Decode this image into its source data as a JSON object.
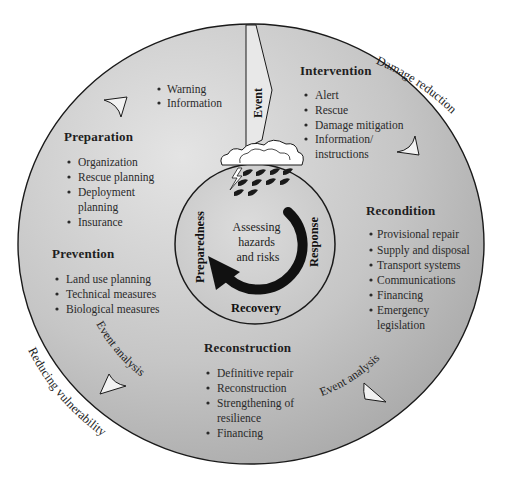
{
  "diagram": {
    "center": {
      "lines": [
        "Assessing",
        "hazards",
        "and risks"
      ],
      "phases": {
        "left": "Preparedness",
        "right": "Response",
        "bottom": "Recovery"
      }
    },
    "event_label": "Event",
    "outer_labels": {
      "damage_reduction": "Damage reduction",
      "reducing_vulnerability": "Reducing vulnerability"
    },
    "event_analysis_labels": [
      "Event analysis",
      "Event analysis"
    ],
    "sections": {
      "warning": {
        "items": [
          "Warning",
          "Information"
        ]
      },
      "preparation": {
        "heading": "Preparation",
        "items": [
          "Organization",
          "Rescue planning",
          "Deployment",
          "planning",
          "Insurance"
        ]
      },
      "prevention": {
        "heading": "Prevention",
        "items": [
          "Land use planning",
          "Technical measures",
          "Biological measures"
        ]
      },
      "intervention": {
        "heading": "Intervention",
        "items": [
          "Alert",
          "Rescue",
          "Damage mitigation",
          "Information/",
          "instructions"
        ]
      },
      "recondition": {
        "heading": "Recondition",
        "items": [
          "Provisional repair",
          "Supply and disposal",
          "Transport systems",
          "Communications",
          "Financing",
          "Emergency",
          "legislation"
        ]
      },
      "reconstruction": {
        "heading": "Reconstruction",
        "items": [
          "Definitive repair",
          "Reconstruction",
          "Strengthening of",
          "resilience",
          "Financing"
        ]
      }
    },
    "colors": {
      "outer_fill_light": "#d9d9d9",
      "outer_fill_dark": "#a9a9a9",
      "inner_fill": "#cfcfcf",
      "stroke": "#1a1a1a",
      "arrow": "#111111"
    }
  }
}
